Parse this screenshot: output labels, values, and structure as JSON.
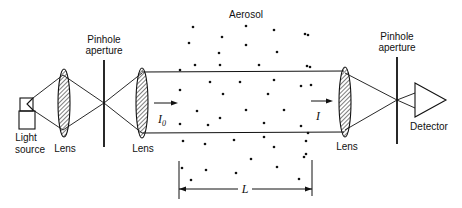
{
  "labels": {
    "aerosol": "Aerosol",
    "pinhole_left_line1": "Pinhole",
    "pinhole_left_line2": "aperture",
    "pinhole_right_line1": "Pinhole",
    "pinhole_right_line2": "aperture",
    "light_source_line1": "Light",
    "light_source_line2": "source",
    "lens1": "Lens",
    "lens2": "Lens",
    "lens3": "Lens",
    "detector": "Detector",
    "incident_intensity": "I",
    "incident_subscript": "0",
    "transmitted_intensity": "I",
    "path_length": "L"
  },
  "colors": {
    "ink": "#111111",
    "background": "#ffffff"
  }
}
